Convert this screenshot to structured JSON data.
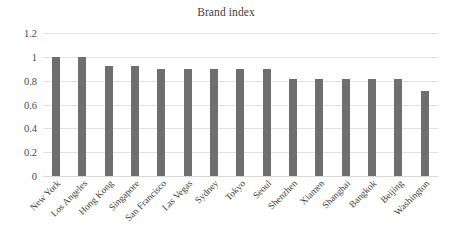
{
  "chart_data": {
    "type": "bar",
    "title": "Brand index",
    "xlabel": "",
    "ylabel": "",
    "ylim": [
      0,
      1.2
    ],
    "grid": true,
    "legend": "none",
    "orientation": "vertical",
    "bar_color": "#6f6f6f",
    "gridline_color": "#e2e2e2",
    "yticks": [
      "0",
      "0.2",
      "0.4",
      "0.6",
      "0.8",
      "1",
      "1.2"
    ],
    "ytick_values": [
      0,
      0.2,
      0.4,
      0.6,
      0.8,
      1,
      1.2
    ],
    "categories": [
      "New York",
      "Los Angeles",
      "Hong Kong",
      "Singapore",
      "San Francisco",
      "Las Vegas",
      "Sydney",
      "Tokyo",
      "Seoul",
      "Shenzhen",
      "Xiamen",
      "Shanghai",
      "Bangkok",
      "Beijing",
      "Washington"
    ],
    "values": [
      1.0,
      1.0,
      0.92,
      0.92,
      0.9,
      0.9,
      0.9,
      0.9,
      0.9,
      0.81,
      0.81,
      0.81,
      0.81,
      0.81,
      0.71
    ]
  }
}
